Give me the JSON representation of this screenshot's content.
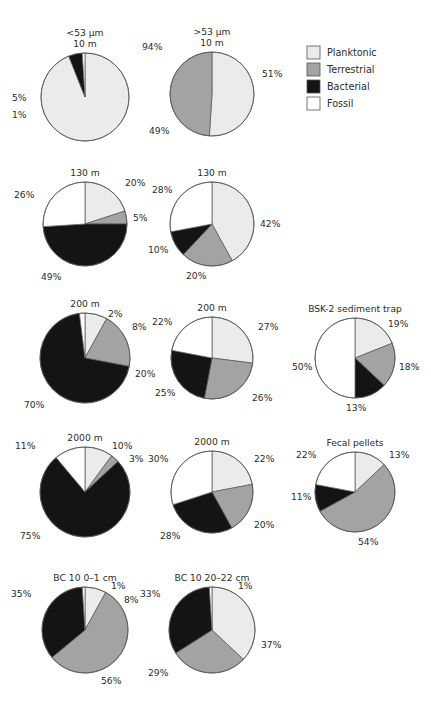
{
  "figure": {
    "title": "",
    "categories": [
      "Planktonic",
      "Terrestrial",
      "Bacterial",
      "Fossil"
    ],
    "colors": {
      "Planktonic": "#ebebeb",
      "Terrestrial": "#a3a3a3",
      "Bacterial": "#141414",
      "Fossil": "#ffffff",
      "outline": "#555555",
      "text": "#2b2b2b",
      "background": "#ffffff"
    }
  },
  "legend": {
    "position": "top-right",
    "items": [
      {
        "label": "Planktonic",
        "color": "#ebebeb"
      },
      {
        "label": "Terrestrial",
        "color": "#a3a3a3"
      },
      {
        "label": "Bacterial",
        "color": "#141414"
      },
      {
        "label": "Fossil",
        "color": "#ffffff"
      }
    ]
  },
  "column_headers": [
    {
      "line1": "<53 µm",
      "line2": "10 m"
    },
    {
      "line1": ">53 µm",
      "line2": "10 m"
    }
  ],
  "chart_data": {
    "type": "pie",
    "title": "",
    "categories": [
      "Planktonic",
      "Terrestrial",
      "Bacterial",
      "Fossil"
    ],
    "start_angle_deg": 0,
    "direction": "clockwise",
    "units": "%",
    "charts": [
      {
        "id": "lt53-10m",
        "title_lines": [
          "<53 µm",
          "10 m"
        ],
        "cx": 85,
        "cy": 97,
        "r": 44,
        "values": [
          94,
          0,
          5,
          1
        ],
        "labels": [
          {
            "text": "94%",
            "x": 142,
            "y": 50
          },
          {
            "text": "5%",
            "x": 12,
            "y": 101
          },
          {
            "text": "1%",
            "x": 12,
            "y": 118
          }
        ]
      },
      {
        "id": "gt53-10m",
        "title_lines": [
          ">53 µm",
          "10 m"
        ],
        "cx": 212,
        "cy": 94,
        "r": 42,
        "values": [
          51,
          49,
          0,
          0
        ],
        "labels": [
          {
            "text": "51%",
            "x": 262,
            "y": 77
          },
          {
            "text": "49%",
            "x": 149,
            "y": 134
          }
        ]
      },
      {
        "id": "lt53-130m",
        "title_lines": [
          "130 m"
        ],
        "cx": 85,
        "cy": 224,
        "r": 42,
        "values": [
          20,
          5,
          49,
          26
        ],
        "labels": [
          {
            "text": "20%",
            "x": 125,
            "y": 186
          },
          {
            "text": "5%",
            "x": 133,
            "y": 221
          },
          {
            "text": "49%",
            "x": 41,
            "y": 280
          },
          {
            "text": "26%",
            "x": 14,
            "y": 198
          }
        ]
      },
      {
        "id": "gt53-130m",
        "title_lines": [
          "130 m"
        ],
        "cx": 212,
        "cy": 224,
        "r": 42,
        "values": [
          42,
          20,
          10,
          28
        ],
        "labels": [
          {
            "text": "42%",
            "x": 260,
            "y": 227
          },
          {
            "text": "20%",
            "x": 186,
            "y": 279
          },
          {
            "text": "10%",
            "x": 148,
            "y": 253
          },
          {
            "text": "28%",
            "x": 152,
            "y": 193
          }
        ]
      },
      {
        "id": "lt53-200m",
        "title_lines": [
          "200 m"
        ],
        "cx": 85,
        "cy": 358,
        "r": 45,
        "values": [
          8,
          20,
          70,
          2
        ],
        "labels": [
          {
            "text": "2%",
            "x": 108,
            "y": 317
          },
          {
            "text": "8%",
            "x": 132,
            "y": 330
          },
          {
            "text": "20%",
            "x": 135,
            "y": 377
          },
          {
            "text": "70%",
            "x": 24,
            "y": 408
          }
        ]
      },
      {
        "id": "gt53-200m",
        "title_lines": [
          "200 m"
        ],
        "cx": 212,
        "cy": 358,
        "r": 41,
        "values": [
          27,
          26,
          25,
          22
        ],
        "labels": [
          {
            "text": "27%",
            "x": 258,
            "y": 330
          },
          {
            "text": "26%",
            "x": 252,
            "y": 401
          },
          {
            "text": "25%",
            "x": 155,
            "y": 396
          },
          {
            "text": "22%",
            "x": 152,
            "y": 325
          }
        ]
      },
      {
        "id": "bsk2-sediment-trap",
        "title_lines": [
          "BSK-2 sediment trap"
        ],
        "cx": 355,
        "cy": 358,
        "r": 40,
        "values": [
          19,
          18,
          13,
          50
        ],
        "labels": [
          {
            "text": "19%",
            "x": 388,
            "y": 327
          },
          {
            "text": "18%",
            "x": 399,
            "y": 370
          },
          {
            "text": "13%",
            "x": 346,
            "y": 411
          },
          {
            "text": "50%",
            "x": 292,
            "y": 370
          }
        ]
      },
      {
        "id": "lt53-2000m",
        "title_lines": [
          "2000 m"
        ],
        "cx": 85,
        "cy": 492,
        "r": 45,
        "values": [
          10,
          3,
          75,
          11
        ],
        "labels": [
          {
            "text": "10%",
            "x": 112,
            "y": 449
          },
          {
            "text": "3%",
            "x": 129,
            "y": 462
          },
          {
            "text": "75%",
            "x": 20,
            "y": 539
          },
          {
            "text": "11%",
            "x": 15,
            "y": 449
          }
        ]
      },
      {
        "id": "gt53-2000m",
        "title_lines": [
          "2000 m"
        ],
        "cx": 212,
        "cy": 492,
        "r": 41,
        "values": [
          22,
          20,
          28,
          30
        ],
        "labels": [
          {
            "text": "22%",
            "x": 254,
            "y": 462
          },
          {
            "text": "20%",
            "x": 254,
            "y": 528
          },
          {
            "text": "28%",
            "x": 160,
            "y": 539
          },
          {
            "text": "30%",
            "x": 148,
            "y": 462
          }
        ]
      },
      {
        "id": "fecal-pellets",
        "title_lines": [
          "Fecal pellets"
        ],
        "cx": 355,
        "cy": 492,
        "r": 40,
        "values": [
          13,
          54,
          11,
          22
        ],
        "labels": [
          {
            "text": "13%",
            "x": 389,
            "y": 458
          },
          {
            "text": "54%",
            "x": 358,
            "y": 545
          },
          {
            "text": "11%",
            "x": 291,
            "y": 500
          },
          {
            "text": "22%",
            "x": 296,
            "y": 458
          }
        ]
      },
      {
        "id": "bc10-0-1cm",
        "title_lines": [
          "BC 10 0–1 cm"
        ],
        "cx": 85,
        "cy": 630,
        "r": 43,
        "values": [
          8,
          56,
          35,
          1
        ],
        "labels": [
          {
            "text": "1%",
            "x": 111,
            "y": 589
          },
          {
            "text": "8%",
            "x": 124,
            "y": 603
          },
          {
            "text": "56%",
            "x": 101,
            "y": 684
          },
          {
            "text": "35%",
            "x": 11,
            "y": 597
          }
        ]
      },
      {
        "id": "bc10-20-22cm",
        "title_lines": [
          "BC 10 20–22 cm"
        ],
        "cx": 212,
        "cy": 630,
        "r": 43,
        "values": [
          37,
          29,
          33,
          1
        ],
        "labels": [
          {
            "text": "1%",
            "x": 238,
            "y": 589
          },
          {
            "text": "37%",
            "x": 261,
            "y": 648
          },
          {
            "text": "29%",
            "x": 148,
            "y": 676
          },
          {
            "text": "33%",
            "x": 140,
            "y": 597
          }
        ]
      }
    ]
  }
}
